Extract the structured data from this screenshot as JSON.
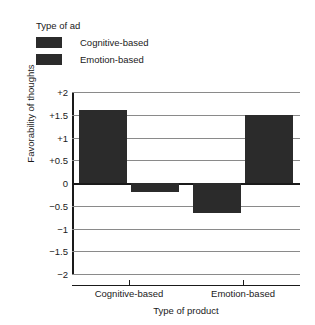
{
  "chart_data": {
    "type": "bar",
    "title": "",
    "xlabel": "Type of product",
    "ylabel": "Favorability of thoughts",
    "categories": [
      "Cognitive-based",
      "Emotion-based"
    ],
    "series": [
      {
        "name": "Cognitive-based",
        "values": [
          1.6,
          -0.65
        ],
        "color": "#2b2b2b"
      },
      {
        "name": "Emotion-based",
        "values": [
          -0.2,
          1.5
        ],
        "color": "#2b2b2b"
      }
    ],
    "ylim": [
      -2,
      2
    ],
    "yticks": [
      "+2",
      "+1.5",
      "+1",
      "+0.5",
      "0",
      "−0.5",
      "−1",
      "−1.5",
      "−2"
    ],
    "ytick_values": [
      2,
      1.5,
      1,
      0.5,
      0,
      -0.5,
      -1,
      -1.5,
      -2
    ],
    "grid": true,
    "legend_position": "top-left"
  },
  "legend": {
    "title": "Type of ad",
    "items": [
      {
        "label": "Cognitive-based",
        "color": "#2b2b2b"
      },
      {
        "label": "Emotion-based",
        "color": "#2b2b2b"
      }
    ]
  }
}
